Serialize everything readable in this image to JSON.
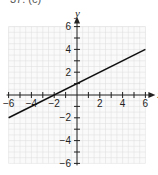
{
  "problem_label": "37. (c)",
  "chart_data": {
    "type": "line",
    "title": "",
    "xlabel": "x",
    "ylabel": "y",
    "xlim": [
      -6,
      6
    ],
    "ylim": [
      -6,
      6
    ],
    "grid": true,
    "x_ticks": [
      -6,
      -4,
      -2,
      2,
      4,
      6
    ],
    "y_ticks": [
      -6,
      -4,
      -2,
      2,
      4,
      6
    ],
    "series": [
      {
        "name": "y = x/2 + 1",
        "x": [
          -6,
          -2,
          0,
          6
        ],
        "y": [
          -2,
          0,
          1,
          4
        ]
      }
    ],
    "shaded_region": "above line (y > x/2 + 1)",
    "colors": {
      "shade": "#e6e6e6",
      "grid": "#dcdcdc",
      "line": "#111111"
    }
  }
}
